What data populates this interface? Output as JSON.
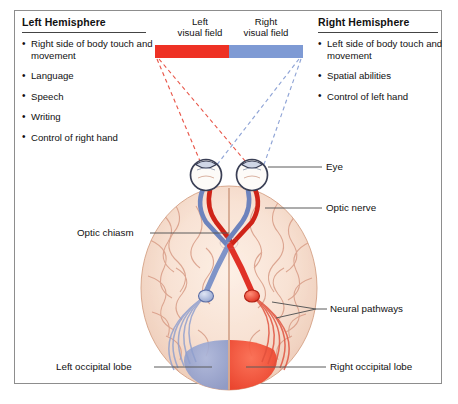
{
  "figure": {
    "frame_color": "#8d8d8d",
    "background": "#ffffff"
  },
  "colors": {
    "left_field_red": "#ee3124",
    "right_field_blue": "#7e9ad4",
    "pathway_red": "#e03127",
    "pathway_blue": "#7f94c8",
    "occipital_red": "#f04a33",
    "occipital_blue": "#93a3cf",
    "brain_fill": "#f7e0d3",
    "brain_gyri": "#d79b85",
    "leader_line": "#5b5b5b",
    "text": "#111111"
  },
  "panels": {
    "left": {
      "heading": "Left Hemisphere",
      "items": [
        "Right side of body touch and movement",
        "Language",
        "Speech",
        "Writing",
        "Control of right hand"
      ]
    },
    "right": {
      "heading": "Right Hemisphere",
      "items": [
        "Left side of body touch and movement",
        "Spatial abilities",
        "Control of left hand"
      ]
    }
  },
  "visual_fields": {
    "left": {
      "label_line1": "Left",
      "label_line2": "visual field",
      "color": "#ee3124"
    },
    "right": {
      "label_line1": "Right",
      "label_line2": "visual field",
      "color": "#7e9ad4"
    }
  },
  "callouts": {
    "eye": "Eye",
    "optic_nerve": "Optic nerve",
    "optic_chiasm": "Optic chiasm",
    "neural_pathways": "Neural pathways",
    "left_occipital_lobe": "Left occipital lobe",
    "right_occipital_lobe": "Right occipital lobe"
  },
  "anatomy": {
    "eye_left": "left-eye",
    "eye_right": "right-eye",
    "chiasm": "optic-chiasm",
    "relay_left": "left-lateral-geniculate-nucleus",
    "relay_right": "right-lateral-geniculate-nucleus",
    "brain": "brain-superior-view"
  }
}
